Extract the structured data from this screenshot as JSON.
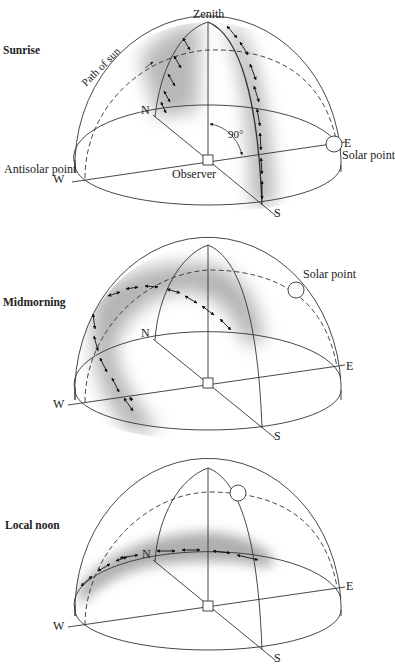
{
  "figure": {
    "panels": [
      {
        "title": "Sunrise",
        "labels": {
          "zenith": "Zenith",
          "path": "Path of sun",
          "north": "N",
          "south": "S",
          "east": "E",
          "west": "W",
          "angle": "90°",
          "observer": "Observer",
          "antisolar": "Antisolar point",
          "solar": "Solar point"
        }
      },
      {
        "title": "Midmorning",
        "labels": {
          "north": "N",
          "south": "S",
          "east": "E",
          "west": "W",
          "solar": "Solar point"
        }
      },
      {
        "title": "Local noon",
        "labels": {
          "north": "N",
          "south": "S",
          "east": "E",
          "west": "W"
        }
      }
    ],
    "colors": {
      "line": "#333333",
      "shade": "#9a9a9a",
      "background": "#ffffff"
    }
  }
}
